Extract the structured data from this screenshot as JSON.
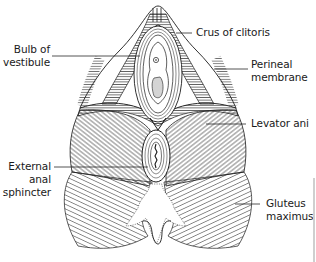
{
  "figure": {
    "colors": {
      "line": "#1a1a1a",
      "hatch": "#2a2a2a",
      "background": "#ffffff",
      "edge_bar": "#cfcfcf"
    }
  },
  "labels": [
    {
      "id": "crus-of-clitoris",
      "lines": [
        "Crus of clitoris"
      ],
      "side": "right"
    },
    {
      "id": "bulb-of-vestibule",
      "lines": [
        "Bulb of",
        "vestibule"
      ],
      "side": "left"
    },
    {
      "id": "perineal-membrane",
      "lines": [
        "Perineal",
        "membrane"
      ],
      "side": "right"
    },
    {
      "id": "levator-ani",
      "lines": [
        "Levator ani"
      ],
      "side": "right"
    },
    {
      "id": "external-anal-sphincter",
      "lines": [
        "External",
        "anal",
        "sphincter"
      ],
      "side": "left"
    },
    {
      "id": "gluteus-maximus",
      "lines": [
        "Gluteus",
        "maximus"
      ],
      "side": "right"
    }
  ]
}
